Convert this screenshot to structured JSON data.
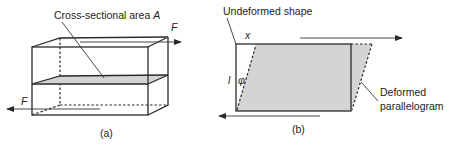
{
  "figure": {
    "panel_a": {
      "caption": "(a)",
      "annotation": "Cross-sectional area ",
      "annotation_symbol": "A",
      "force_top_label": "F",
      "force_bottom_label": "F"
    },
    "panel_b": {
      "caption": "(b)",
      "undeformed_label": "Undeformed shape",
      "deformed_label_line1": "Deformed",
      "deformed_label_line2": "parallelogram",
      "displacement_label": "x",
      "height_label": "l",
      "angle_label": "φ"
    },
    "colors": {
      "line": "#2a2a2a",
      "shade": "#d4d4d4",
      "background": "#ffffff"
    }
  }
}
